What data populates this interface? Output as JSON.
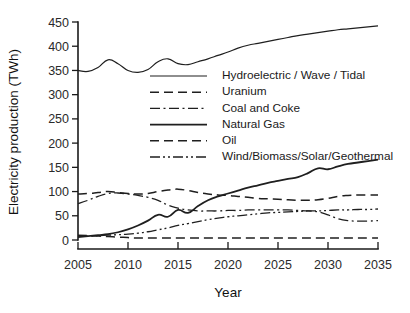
{
  "chart_data": {
    "type": "line",
    "title": "",
    "xlabel": "Year",
    "ylabel": "Electricity production (TWh)",
    "xlim": [
      2005,
      2035
    ],
    "ylim": [
      0,
      450
    ],
    "xticks": [
      2005,
      2010,
      2015,
      2020,
      2025,
      2030,
      2035
    ],
    "yticks": [
      0,
      50,
      100,
      150,
      200,
      250,
      300,
      350,
      400,
      450
    ],
    "grid": false,
    "legend_position": "center",
    "x": [
      2005,
      2006,
      2007,
      2008,
      2009,
      2010,
      2011,
      2012,
      2013,
      2014,
      2015,
      2016,
      2017,
      2018,
      2019,
      2020,
      2021,
      2022,
      2023,
      2024,
      2025,
      2026,
      2027,
      2028,
      2029,
      2030,
      2031,
      2032,
      2033,
      2034,
      2035
    ],
    "series": [
      {
        "name": "Hydroelectric / Wave / Tidal",
        "style": "solid",
        "width": 1.2,
        "values": [
          350,
          348,
          356,
          372,
          364,
          350,
          346,
          352,
          368,
          374,
          364,
          362,
          368,
          374,
          381,
          388,
          396,
          402,
          406,
          410,
          414,
          418,
          422,
          425,
          428,
          431,
          434,
          436,
          438,
          440,
          442
        ]
      },
      {
        "name": "Uranium",
        "style": "dashed",
        "width": 1.5,
        "values": [
          95,
          96,
          98,
          100,
          98,
          96,
          95,
          96,
          100,
          103,
          105,
          102,
          98,
          95,
          93,
          92,
          90,
          88,
          86,
          85,
          84,
          83,
          82,
          82,
          83,
          86,
          90,
          92,
          93,
          93,
          93
        ]
      },
      {
        "name": "Coal and Coke",
        "style": "dashdot",
        "width": 1.3,
        "values": [
          75,
          82,
          90,
          96,
          97,
          95,
          92,
          88,
          82,
          72,
          66,
          62,
          60,
          60,
          60,
          61,
          61,
          62,
          62,
          62,
          62,
          62,
          61,
          60,
          58,
          52,
          44,
          40,
          39,
          39,
          40
        ]
      },
      {
        "name": "Natural Gas",
        "style": "solid",
        "width": 1.8,
        "values": [
          6,
          8,
          10,
          12,
          16,
          22,
          30,
          40,
          52,
          48,
          62,
          56,
          70,
          82,
          90,
          96,
          102,
          108,
          113,
          118,
          122,
          126,
          130,
          138,
          148,
          146,
          152,
          157,
          160,
          163,
          166
        ]
      },
      {
        "name": "Oil",
        "style": "dashed",
        "width": 1.5,
        "values": [
          10,
          9,
          8,
          7,
          6,
          5,
          4,
          4,
          4,
          4,
          4,
          4,
          4,
          4,
          4,
          4,
          4,
          4,
          4,
          4,
          4,
          4,
          4,
          4,
          4,
          4,
          4,
          4,
          4,
          4,
          4
        ]
      },
      {
        "name": "Wind/Biomass/Solar/Geothermal",
        "style": "dashdotdot",
        "width": 1.3,
        "values": [
          8,
          8,
          9,
          10,
          11,
          12,
          14,
          17,
          21,
          25,
          30,
          34,
          38,
          42,
          45,
          48,
          50,
          52,
          54,
          56,
          57,
          58,
          59,
          60,
          60,
          61,
          62,
          62,
          63,
          63,
          64
        ]
      }
    ]
  },
  "legend": {
    "items": [
      {
        "label": "Hydroelectric / Wave / Tidal"
      },
      {
        "label": "Uranium"
      },
      {
        "label": "Coal and Coke"
      },
      {
        "label": "Natural Gas"
      },
      {
        "label": "Oil"
      },
      {
        "label": "Wind/Biomass/Solar/Geothermal"
      }
    ]
  },
  "colors": {
    "ink": "#1f1f1f",
    "background": "#ffffff"
  }
}
